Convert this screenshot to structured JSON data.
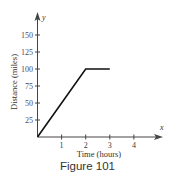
{
  "chart_data": {
    "type": "line",
    "title": "",
    "xlabel": "Time (hours)",
    "ylabel": "Distance (miles)",
    "x_axis_letter": "x",
    "y_axis_letter": "y",
    "x_ticks": [
      1,
      2,
      3,
      4
    ],
    "y_ticks": [
      25,
      50,
      75,
      100,
      125,
      150
    ],
    "xlim": [
      0,
      5
    ],
    "ylim": [
      0,
      175
    ],
    "grid": false,
    "legend": null,
    "series": [
      {
        "name": "distance",
        "points": [
          [
            0,
            0
          ],
          [
            2,
            100
          ],
          [
            3,
            100
          ]
        ],
        "color": "#111111"
      }
    ],
    "colors": {
      "axis": "#444444",
      "line": "#111111",
      "y_tick_labels": "#4a4a6a"
    }
  },
  "caption": "Figure 101"
}
